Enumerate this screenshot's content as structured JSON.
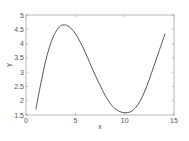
{
  "chart_data": {
    "type": "line",
    "title": "",
    "xlabel": "x",
    "ylabel": "y",
    "xlim": [
      0,
      15
    ],
    "ylim": [
      1.5,
      5
    ],
    "xticks": [
      0,
      5,
      10,
      15
    ],
    "yticks": [
      1.5,
      2,
      2.5,
      3,
      3.5,
      4,
      4.5,
      5
    ],
    "xtick_labels": [
      "0",
      "5",
      "10",
      "15"
    ],
    "ytick_labels": [
      "1.5",
      "2",
      "2.5",
      "3",
      "3.5",
      "4",
      "4.5",
      "5"
    ],
    "grid": false,
    "legend": null,
    "series": [
      {
        "name": "y",
        "color": "#555555",
        "x": [
          1,
          1.5,
          2,
          2.5,
          3,
          3.5,
          4,
          4.5,
          5,
          5.5,
          6,
          6.5,
          7,
          7.5,
          8,
          8.5,
          9,
          9.5,
          10,
          10.5,
          11,
          11.5,
          12,
          12.5,
          13,
          13.5,
          14.1
        ],
        "y": [
          1.7,
          2.6,
          3.4,
          4.0,
          4.4,
          4.62,
          4.65,
          4.55,
          4.35,
          4.05,
          3.7,
          3.3,
          2.9,
          2.55,
          2.2,
          1.92,
          1.73,
          1.62,
          1.58,
          1.6,
          1.72,
          1.95,
          2.3,
          2.75,
          3.25,
          3.75,
          4.35
        ]
      }
    ]
  }
}
